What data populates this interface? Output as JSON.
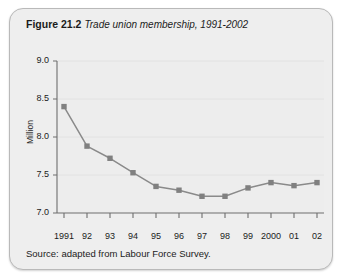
{
  "figure": {
    "number": "Figure 21.2",
    "caption": "Trade union membership, 1991-2002",
    "source": "Source: adapted from Labour Force Survey."
  },
  "colors": {
    "card_background": "#eeeeee",
    "plot_background": "#ededed",
    "series_line": "#8a8a8a",
    "marker": "#808080",
    "axis": "#6e6e6e",
    "gridline": "#e2e2e2",
    "text": "#1b1b1b"
  },
  "chart_data": {
    "type": "line",
    "title": "Trade union membership, 1991-2002",
    "xlabel": "",
    "ylabel": "Million",
    "ylim": [
      7.0,
      9.0
    ],
    "ytick_values": [
      7.0,
      7.5,
      8.0,
      8.5,
      9.0
    ],
    "ytick_labels": [
      "7.0",
      "7.5",
      "8.0",
      "8.5",
      "9.0"
    ],
    "grid": true,
    "legend": "none",
    "categories": [
      "1991",
      "92",
      "93",
      "94",
      "95",
      "96",
      "97",
      "98",
      "99",
      "2000",
      "01",
      "02"
    ],
    "x": [
      1991,
      1992,
      1993,
      1994,
      1995,
      1996,
      1997,
      1998,
      1999,
      2000,
      2001,
      2002
    ],
    "series": [
      {
        "name": "Trade union membership",
        "units": "Million",
        "values": [
          8.4,
          7.88,
          7.72,
          7.53,
          7.35,
          7.3,
          7.22,
          7.22,
          7.33,
          7.4,
          7.36,
          7.4
        ]
      }
    ]
  }
}
